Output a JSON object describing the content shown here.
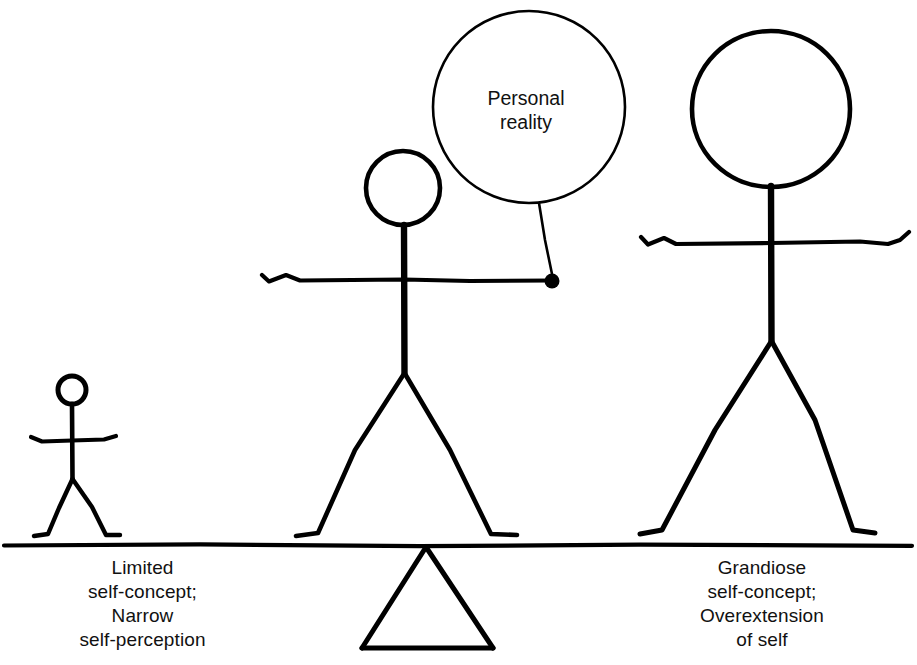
{
  "diagram": {
    "background_color": "#ffffff",
    "ink_color": "#000000",
    "ground": {
      "name": "plank",
      "y": 545,
      "x_start": 4,
      "x_end": 912
    },
    "fulcrum": {
      "name": "fulcrum-triangle",
      "apex_x": 426,
      "apex_y": 546,
      "base_left_x": 362,
      "base_right_x": 493,
      "base_y": 648
    },
    "figures": [
      {
        "id": "small-figure",
        "label": "Limited self-concept figure",
        "head": {
          "cx": 72,
          "cy": 390,
          "r": 14
        },
        "body": {
          "x": 72,
          "y_top": 404,
          "y_bottom": 478
        },
        "arms": {
          "y": 440,
          "x_left": 30,
          "x_right": 116
        },
        "legs": {
          "hip_x": 72,
          "hip_y": 478,
          "foot_left_x": 42,
          "foot_right_x": 110,
          "foot_y": 537
        }
      },
      {
        "id": "middle-figure",
        "label": "Balanced figure holding personal reality balloon",
        "head": {
          "cx": 403,
          "cy": 188,
          "r": 37
        },
        "body": {
          "x": 404,
          "y_top": 226,
          "y_bottom": 372
        },
        "arms": {
          "y": 280,
          "x_left": 262,
          "x_right": 551
        },
        "legs": {
          "hip_x": 404,
          "hip_y": 372,
          "foot_left_x": 312,
          "foot_right_x": 496,
          "foot_y": 536
        },
        "hand_dot": {
          "cx": 552,
          "cy": 281,
          "r": 7
        }
      },
      {
        "id": "large-figure",
        "label": "Grandiose self-concept figure",
        "head": {
          "cx": 771,
          "cy": 109,
          "rx": 79,
          "ry": 78
        },
        "body": {
          "x": 771,
          "y_top": 187,
          "y_bottom": 340
        },
        "arms": {
          "y": 243,
          "x_left": 641,
          "x_right": 909
        },
        "legs": {
          "hip_x": 771,
          "hip_y": 340,
          "foot_left_x": 650,
          "foot_right_x": 856,
          "foot_y": 535
        }
      }
    ],
    "balloon": {
      "name": "personal-reality-balloon",
      "cx": 529,
      "cy": 107,
      "r": 96,
      "line_1": "Personal",
      "line_2": "reality",
      "string": {
        "x1": 539,
        "y1": 204,
        "x2": 552,
        "y2": 276
      }
    },
    "captions": {
      "left": "Limited\nself-concept;\nNarrow\nself-perception",
      "right": "Grandiose\nself-concept;\nOverextension\nof self"
    }
  }
}
